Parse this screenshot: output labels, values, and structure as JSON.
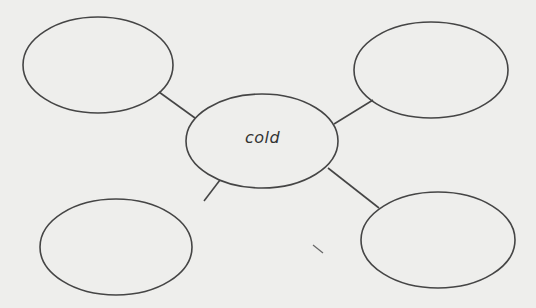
{
  "worksheet": {
    "type": "word-web",
    "center": {
      "label": "cold"
    },
    "bubbles": [
      {
        "position": "top-left",
        "text": ""
      },
      {
        "position": "top-right",
        "text": ""
      },
      {
        "position": "bottom-left",
        "text": ""
      },
      {
        "position": "bottom-right",
        "text": ""
      }
    ]
  },
  "colors": {
    "background": "#eeeeec",
    "stroke": "#454545",
    "text": "#333333"
  }
}
